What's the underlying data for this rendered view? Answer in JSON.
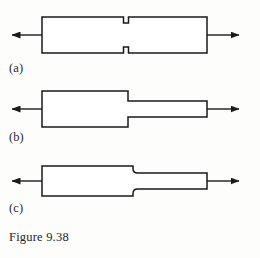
{
  "figure": {
    "caption": "Figure 9.38",
    "background_color": "#fdfdfc",
    "line_color": "#1a1a1a",
    "fill_color": "#ffffff",
    "panels": [
      {
        "id": "a",
        "label": "(a)",
        "description": "Prismatic bar with small opposing notches at mid-length, loaded in tension",
        "bar": {
          "left": 42,
          "right": 207,
          "top": 17,
          "bottom": 53,
          "height": 36
        },
        "notch": {
          "center_x": 126,
          "width": 5,
          "depth": 6,
          "top_notch": true,
          "bottom_notch": true
        },
        "arrows": [
          {
            "name": "left-load-arrow",
            "direction": "left",
            "from_x": 42,
            "to_x": 8,
            "y": 35
          },
          {
            "name": "right-load-arrow",
            "direction": "right",
            "from_x": 207,
            "to_x": 243,
            "y": 35
          }
        ]
      },
      {
        "id": "b",
        "label": "(b)",
        "description": "Stepped bar with sharp shoulder transition, loaded in tension",
        "wide_section": {
          "left": 42,
          "right": 128,
          "top": 91,
          "bottom": 127,
          "height": 36
        },
        "narrow_section": {
          "left": 128,
          "right": 207,
          "top": 101,
          "bottom": 117,
          "height": 16
        },
        "fillet_radius": 0,
        "arrows": [
          {
            "name": "left-load-arrow",
            "direction": "left",
            "from_x": 42,
            "to_x": 8,
            "y": 109
          },
          {
            "name": "right-load-arrow",
            "direction": "right",
            "from_x": 207,
            "to_x": 243,
            "y": 109
          }
        ]
      },
      {
        "id": "c",
        "label": "(c)",
        "description": "Stepped bar with filleted shoulder transition, loaded in tension",
        "wide_section": {
          "left": 42,
          "right": 133,
          "top": 166,
          "bottom": 196,
          "height": 30
        },
        "narrow_section": {
          "left": 133,
          "right": 207,
          "top": 173,
          "bottom": 189,
          "height": 16
        },
        "fillet_radius": 5,
        "arrows": [
          {
            "name": "left-load-arrow",
            "direction": "left",
            "from_x": 42,
            "to_x": 8,
            "y": 181
          },
          {
            "name": "right-load-arrow",
            "direction": "right",
            "from_x": 207,
            "to_x": 243,
            "y": 181
          }
        ]
      }
    ]
  }
}
